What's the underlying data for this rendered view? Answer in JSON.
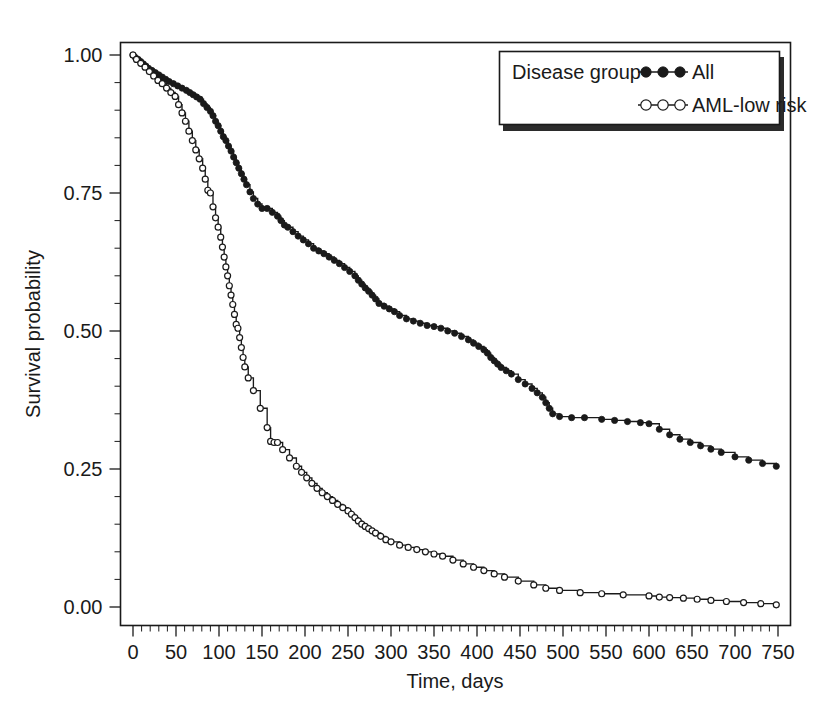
{
  "chart_data": {
    "type": "line",
    "title": "",
    "xlabel": "Time, days",
    "ylabel": "Survival probability",
    "xlim": [
      0,
      750
    ],
    "ylim": [
      0,
      1
    ],
    "grid": false,
    "legend_position": "top-right",
    "legend_title": "Disease group",
    "x_ticks": [
      0,
      50,
      100,
      150,
      200,
      250,
      300,
      350,
      400,
      450,
      500,
      550,
      600,
      650,
      700,
      750
    ],
    "x_tick_labels": [
      "0",
      "50",
      "100",
      "150",
      "200",
      "250",
      "300",
      "350",
      "400",
      "450",
      "500",
      "550",
      "600",
      "650",
      "700",
      "750"
    ],
    "x_minor_tick_step": 10,
    "y_ticks": [
      0.0,
      0.25,
      0.5,
      0.75,
      1.0
    ],
    "y_tick_labels": [
      "0.00",
      "0.25",
      "0.50",
      "0.75",
      "1.00"
    ],
    "y_minor_tick_step": 0.05,
    "series": [
      {
        "name": "All",
        "marker": "filled-circle",
        "color": "#1a1a1a",
        "step": "post",
        "x": [
          0,
          3,
          6,
          9,
          12,
          15,
          18,
          22,
          26,
          30,
          34,
          38,
          42,
          47,
          52,
          57,
          62,
          66,
          70,
          74,
          78,
          82,
          86,
          90,
          93,
          96,
          99,
          102,
          105,
          108,
          111,
          114,
          117,
          120,
          123,
          126,
          129,
          132,
          136,
          140,
          145,
          150,
          156,
          162,
          168,
          172,
          176,
          180,
          186,
          192,
          198,
          204,
          210,
          216,
          222,
          228,
          234,
          240,
          246,
          252,
          258,
          262,
          266,
          270,
          274,
          278,
          282,
          286,
          292,
          298,
          304,
          310,
          318,
          326,
          334,
          342,
          350,
          358,
          366,
          374,
          382,
          390,
          396,
          402,
          408,
          412,
          416,
          420,
          424,
          428,
          434,
          440,
          448,
          456,
          464,
          470,
          476,
          480,
          484,
          488,
          496,
          510,
          525,
          545,
          560,
          575,
          590,
          600,
          612,
          624,
          636,
          648,
          660,
          672,
          684,
          700,
          716,
          732,
          748
        ],
        "y": [
          1.0,
          0.995,
          0.992,
          0.988,
          0.984,
          0.98,
          0.976,
          0.972,
          0.968,
          0.964,
          0.96,
          0.956,
          0.952,
          0.948,
          0.944,
          0.94,
          0.936,
          0.932,
          0.928,
          0.924,
          0.92,
          0.912,
          0.905,
          0.898,
          0.89,
          0.88,
          0.872,
          0.862,
          0.852,
          0.845,
          0.835,
          0.826,
          0.815,
          0.805,
          0.795,
          0.785,
          0.775,
          0.765,
          0.752,
          0.74,
          0.73,
          0.722,
          0.722,
          0.715,
          0.708,
          0.7,
          0.692,
          0.688,
          0.68,
          0.672,
          0.665,
          0.658,
          0.65,
          0.645,
          0.64,
          0.634,
          0.628,
          0.622,
          0.615,
          0.608,
          0.6,
          0.592,
          0.585,
          0.578,
          0.572,
          0.565,
          0.558,
          0.55,
          0.545,
          0.54,
          0.535,
          0.528,
          0.522,
          0.518,
          0.514,
          0.51,
          0.508,
          0.505,
          0.5,
          0.496,
          0.49,
          0.484,
          0.478,
          0.472,
          0.466,
          0.46,
          0.452,
          0.446,
          0.44,
          0.434,
          0.428,
          0.422,
          0.412,
          0.404,
          0.396,
          0.388,
          0.38,
          0.37,
          0.36,
          0.35,
          0.345,
          0.343,
          0.343,
          0.34,
          0.338,
          0.336,
          0.334,
          0.332,
          0.322,
          0.312,
          0.304,
          0.298,
          0.292,
          0.286,
          0.28,
          0.272,
          0.266,
          0.26,
          0.255
        ]
      },
      {
        "name": "AML-low risk",
        "marker": "open-circle",
        "color": "#1a1a1a",
        "step": "post",
        "x": [
          0,
          4,
          9,
          14,
          19,
          24,
          29,
          34,
          39,
          44,
          49,
          53,
          57,
          61,
          65,
          69,
          73,
          77,
          81,
          84,
          87,
          90,
          93,
          96,
          99,
          102,
          104,
          106,
          108,
          110,
          112,
          114,
          116,
          118,
          120,
          122,
          124,
          126,
          128,
          130,
          134,
          140,
          148,
          156,
          160,
          164,
          168,
          174,
          182,
          190,
          196,
          202,
          208,
          214,
          220,
          226,
          232,
          238,
          244,
          250,
          254,
          258,
          262,
          266,
          270,
          274,
          278,
          282,
          288,
          294,
          300,
          310,
          320,
          330,
          340,
          350,
          360,
          372,
          384,
          396,
          408,
          420,
          432,
          448,
          466,
          480,
          496,
          520,
          545,
          570,
          600,
          612,
          624,
          640,
          656,
          672,
          690,
          710,
          730,
          748
        ],
        "y": [
          1.0,
          0.992,
          0.985,
          0.978,
          0.97,
          0.962,
          0.954,
          0.948,
          0.94,
          0.932,
          0.925,
          0.91,
          0.895,
          0.88,
          0.862,
          0.845,
          0.828,
          0.812,
          0.795,
          0.775,
          0.755,
          0.75,
          0.725,
          0.705,
          0.688,
          0.67,
          0.652,
          0.634,
          0.616,
          0.6,
          0.582,
          0.565,
          0.548,
          0.53,
          0.512,
          0.505,
          0.488,
          0.47,
          0.452,
          0.435,
          0.415,
          0.392,
          0.36,
          0.325,
          0.3,
          0.298,
          0.298,
          0.285,
          0.27,
          0.255,
          0.244,
          0.234,
          0.224,
          0.215,
          0.207,
          0.2,
          0.193,
          0.186,
          0.18,
          0.174,
          0.168,
          0.162,
          0.156,
          0.15,
          0.146,
          0.142,
          0.138,
          0.134,
          0.128,
          0.122,
          0.118,
          0.112,
          0.108,
          0.104,
          0.1,
          0.096,
          0.092,
          0.085,
          0.078,
          0.072,
          0.066,
          0.06,
          0.054,
          0.047,
          0.04,
          0.034,
          0.03,
          0.026,
          0.024,
          0.022,
          0.02,
          0.018,
          0.017,
          0.016,
          0.014,
          0.012,
          0.01,
          0.008,
          0.006,
          0.004
        ]
      }
    ]
  },
  "axes": {
    "x_title": "Time, days",
    "y_title": "Survival probability"
  },
  "legend": {
    "title": "Disease group",
    "entries": [
      {
        "label": "All",
        "marker": "filled-circle"
      },
      {
        "label": "AML-low risk",
        "marker": "open-circle"
      }
    ]
  },
  "colors": {
    "foreground": "#1a1a1a",
    "background": "#ffffff",
    "legend_shadow": "#2b2b2b"
  }
}
